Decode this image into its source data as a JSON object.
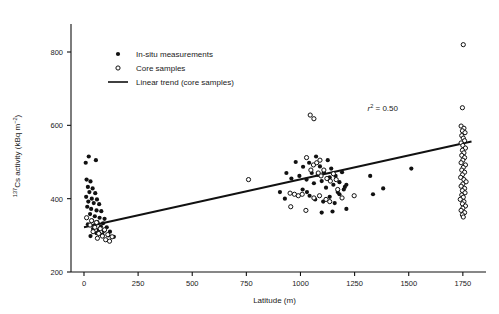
{
  "chart_data": {
    "type": "scatter",
    "title": "",
    "xlabel": "Latitude (m)",
    "ylabel": "137Cs activity (kBq m-2)",
    "ylabel_parts": {
      "sup_pre": "137",
      "base": "Cs activity (kBq m",
      "sup_post": "−2",
      "close": ")"
    },
    "xlim": [
      -60,
      1820
    ],
    "ylim": [
      200,
      860
    ],
    "xticks": [
      0,
      250,
      500,
      750,
      1000,
      1250,
      1500,
      1750
    ],
    "xtick_labels": [
      "0",
      "250",
      "500",
      "750",
      "1000",
      "1250",
      "1500",
      "1750"
    ],
    "yticks": [
      200,
      400,
      600,
      800
    ],
    "ytick_labels": [
      "200",
      "400",
      "600",
      "800"
    ],
    "grid": false,
    "legend_position": "top-left",
    "annotations": [
      {
        "name": "r-squared",
        "text_parts": {
          "italic": "r",
          "sup": "2",
          "rest": " = 0.50"
        },
        "text": "r2 = 0.50",
        "x": 1380,
        "y": 640
      }
    ],
    "trend": {
      "name": "Linear trend (core samples)",
      "x_start": 0,
      "y_start": 322,
      "x_end": 1790,
      "y_end": 556,
      "r_squared": 0.5
    },
    "series": [
      {
        "name": "In-situ measurements",
        "marker": "filled-circle",
        "color": "#111111",
        "points": [
          [
            8,
            498
          ],
          [
            22,
            515
          ],
          [
            55,
            505
          ],
          [
            12,
            452
          ],
          [
            30,
            447
          ],
          [
            18,
            432
          ],
          [
            40,
            428
          ],
          [
            25,
            418
          ],
          [
            52,
            415
          ],
          [
            10,
            405
          ],
          [
            36,
            400
          ],
          [
            60,
            398
          ],
          [
            20,
            392
          ],
          [
            45,
            388
          ],
          [
            70,
            385
          ],
          [
            15,
            378
          ],
          [
            33,
            372
          ],
          [
            58,
            368
          ],
          [
            80,
            366
          ],
          [
            28,
            358
          ],
          [
            50,
            352
          ],
          [
            72,
            348
          ],
          [
            95,
            345
          ],
          [
            38,
            340
          ],
          [
            62,
            336
          ],
          [
            88,
            333
          ],
          [
            18,
            330
          ],
          [
            48,
            327
          ],
          [
            78,
            324
          ],
          [
            105,
            322
          ],
          [
            42,
            318
          ],
          [
            68,
            315
          ],
          [
            92,
            312
          ],
          [
            120,
            310
          ],
          [
            58,
            306
          ],
          [
            85,
            302
          ],
          [
            112,
            300
          ],
          [
            30,
            298
          ],
          [
            138,
            296
          ],
          [
            935,
            470
          ],
          [
            958,
            455
          ],
          [
            978,
            500
          ],
          [
            995,
            462
          ],
          [
            1012,
            487
          ],
          [
            1028,
            452
          ],
          [
            1040,
            498
          ],
          [
            1052,
            470
          ],
          [
            1062,
            442
          ],
          [
            1072,
            515
          ],
          [
            1080,
            465
          ],
          [
            1090,
            488
          ],
          [
            1098,
            448
          ],
          [
            1108,
            472
          ],
          [
            1118,
            430
          ],
          [
            1126,
            505
          ],
          [
            1135,
            458
          ],
          [
            1142,
            482
          ],
          [
            1152,
            438
          ],
          [
            1162,
            462
          ],
          [
            1172,
            418
          ],
          [
            1180,
            445
          ],
          [
            1192,
            472
          ],
          [
            1200,
            425
          ],
          [
            1042,
            408
          ],
          [
            1068,
            398
          ],
          [
            1105,
            392
          ],
          [
            1135,
            405
          ],
          [
            1158,
            388
          ],
          [
            1180,
            412
          ],
          [
            1205,
            432
          ],
          [
            1212,
            438
          ],
          [
            1010,
            425
          ],
          [
            1030,
            418
          ],
          [
            905,
            418
          ],
          [
            928,
            400
          ],
          [
            1148,
            365
          ],
          [
            1098,
            362
          ],
          [
            1212,
            372
          ],
          [
            1322,
            462
          ],
          [
            1335,
            412
          ],
          [
            1382,
            428
          ],
          [
            1512,
            482
          ]
        ]
      },
      {
        "name": "Core samples",
        "marker": "open-circle",
        "color": "#111111",
        "points": [
          [
            12,
            348
          ],
          [
            35,
            340
          ],
          [
            58,
            335
          ],
          [
            28,
            328
          ],
          [
            50,
            322
          ],
          [
            75,
            318
          ],
          [
            95,
            315
          ],
          [
            42,
            310
          ],
          [
            68,
            305
          ],
          [
            110,
            302
          ],
          [
            85,
            298
          ],
          [
            62,
            292
          ],
          [
            130,
            296
          ],
          [
            100,
            288
          ],
          [
            118,
            284
          ],
          [
            760,
            452
          ],
          [
            1045,
            628
          ],
          [
            1062,
            618
          ],
          [
            1028,
            512
          ],
          [
            1048,
            478
          ],
          [
            1060,
            492
          ],
          [
            1075,
            498
          ],
          [
            1090,
            505
          ],
          [
            1082,
            470
          ],
          [
            1095,
            462
          ],
          [
            1108,
            478
          ],
          [
            1122,
            455
          ],
          [
            1138,
            448
          ],
          [
            1152,
            468
          ],
          [
            1165,
            452
          ],
          [
            952,
            415
          ],
          [
            972,
            412
          ],
          [
            990,
            408
          ],
          [
            1008,
            412
          ],
          [
            1118,
            398
          ],
          [
            1135,
            392
          ],
          [
            1088,
            408
          ],
          [
            1062,
            402
          ],
          [
            955,
            378
          ],
          [
            1025,
            368
          ],
          [
            1172,
            425
          ],
          [
            1192,
            402
          ],
          [
            1248,
            408
          ],
          [
            1752,
            820
          ],
          [
            1748,
            648
          ],
          [
            1742,
            598
          ],
          [
            1755,
            592
          ],
          [
            1748,
            585
          ],
          [
            1760,
            580
          ],
          [
            1745,
            572
          ],
          [
            1752,
            565
          ],
          [
            1758,
            558
          ],
          [
            1742,
            552
          ],
          [
            1750,
            545
          ],
          [
            1762,
            538
          ],
          [
            1748,
            532
          ],
          [
            1755,
            525
          ],
          [
            1745,
            518
          ],
          [
            1758,
            512
          ],
          [
            1750,
            505
          ],
          [
            1742,
            498
          ],
          [
            1762,
            492
          ],
          [
            1752,
            485
          ],
          [
            1745,
            478
          ],
          [
            1758,
            472
          ],
          [
            1748,
            465
          ],
          [
            1740,
            458
          ],
          [
            1755,
            452
          ],
          [
            1765,
            446
          ],
          [
            1750,
            440
          ],
          [
            1742,
            434
          ],
          [
            1758,
            428
          ],
          [
            1748,
            422
          ],
          [
            1760,
            416
          ],
          [
            1745,
            410
          ],
          [
            1752,
            404
          ],
          [
            1738,
            398
          ],
          [
            1755,
            392
          ],
          [
            1748,
            386
          ],
          [
            1762,
            380
          ],
          [
            1750,
            374
          ],
          [
            1742,
            368
          ],
          [
            1758,
            362
          ],
          [
            1748,
            356
          ],
          [
            1752,
            350
          ]
        ]
      }
    ]
  },
  "legend": {
    "items": [
      {
        "label": "In-situ measurements",
        "marker": "filled-circle"
      },
      {
        "label": "Core samples",
        "marker": "open-circle"
      },
      {
        "label": "Linear trend (core samples)",
        "marker": "line"
      }
    ]
  }
}
